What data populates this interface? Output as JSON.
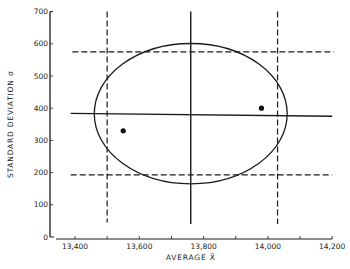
{
  "chart_data": {
    "type": "scatter",
    "title": "",
    "xlabel": "AVERAGE X̄",
    "ylabel": "STANDARD DEVIATION σ",
    "xlim": [
      13340,
      14200
    ],
    "ylim": [
      0,
      700
    ],
    "x_ticks": [
      13400,
      13500,
      13600,
      13700,
      13800,
      13900,
      14000,
      14100,
      14200
    ],
    "x_tick_labels": [
      "13,400",
      "",
      "13,600",
      "",
      "13,800",
      "",
      "14,000",
      "",
      "14,200"
    ],
    "y_ticks": [
      0,
      100,
      200,
      300,
      400,
      500,
      600,
      700
    ],
    "y_tick_labels": [
      "0",
      "100",
      "200",
      "300",
      "400",
      "500",
      "600",
      "700"
    ],
    "grid": false,
    "legend": null,
    "series": [
      {
        "name": "observed points",
        "kind": "scatter",
        "points": [
          {
            "x": 13550,
            "y": 330
          },
          {
            "x": 13980,
            "y": 400
          }
        ]
      }
    ],
    "reference_lines": [
      {
        "name": "mean-average-line",
        "orientation": "vertical",
        "style": "solid",
        "x": 13760,
        "y_range": [
          40,
          700
        ]
      },
      {
        "name": "mean-sigma-line",
        "orientation": "horizontal",
        "style": "solid",
        "y_left": 384,
        "y_right": 375,
        "x_range": [
          13340,
          14200
        ]
      },
      {
        "name": "lower-average-limit",
        "orientation": "vertical",
        "style": "dashed",
        "x": 13500,
        "y_range": [
          45,
          700
        ]
      },
      {
        "name": "upper-average-limit",
        "orientation": "vertical",
        "style": "dashed",
        "x": 14030,
        "y_range": [
          40,
          700
        ]
      },
      {
        "name": "upper-sigma-limit",
        "orientation": "horizontal",
        "style": "dashed",
        "y": 575,
        "x_range": [
          13345,
          14205
        ]
      },
      {
        "name": "lower-sigma-limit",
        "orientation": "horizontal",
        "style": "dashed",
        "y": 193,
        "x_range": [
          13340,
          14200
        ]
      }
    ],
    "ellipse": {
      "name": "confidence-ellipse",
      "center": {
        "x": 13760,
        "y": 383
      },
      "x_semi_axis": 300,
      "y_semi_axis": 218
    }
  }
}
